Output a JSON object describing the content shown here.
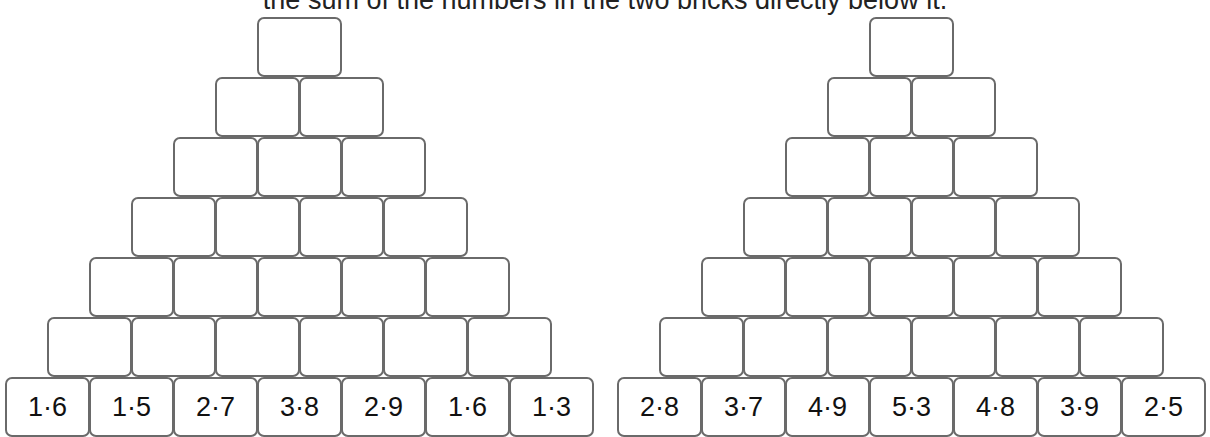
{
  "instruction": "the sum of the numbers in the two bricks directly below it.",
  "layout": {
    "brick_width": 84,
    "row_height": 60,
    "bottom_row_top": 377,
    "rows": 7
  },
  "pyramids": [
    {
      "name": "left",
      "origin_x": 5,
      "bottom_row": [
        "1·6",
        "1·5",
        "2·7",
        "3·8",
        "2·9",
        "1·6",
        "1·3"
      ]
    },
    {
      "name": "right",
      "origin_x": 617,
      "bottom_row": [
        "2·8",
        "3·7",
        "4·9",
        "5·3",
        "4·8",
        "3·9",
        "2·5"
      ]
    }
  ]
}
